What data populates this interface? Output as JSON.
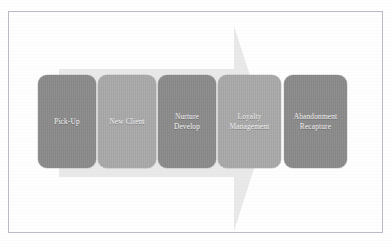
{
  "slide": {
    "title": "Client Lifecycle Process Flow",
    "background_color": "#ffffff",
    "frame_border_color": "#b9bcc4"
  },
  "arrow": {
    "name": "process-flow-arrow",
    "direction": "right",
    "color": "#e9e9e9",
    "shaft_top_y": 57,
    "shaft_bottom_y": 165,
    "head_start_x": 225,
    "tip_x": 258,
    "head_top_y": 14,
    "head_bottom_y": 219
  },
  "stages": [
    {
      "id": "pick-up",
      "label": "Pick-Up",
      "tone": "dark",
      "color": "#8b8b8b",
      "order": 1
    },
    {
      "id": "new-client",
      "label": "New Client",
      "tone": "light",
      "color": "#a9a9a9",
      "order": 2
    },
    {
      "id": "nurture-develop",
      "label": "Nurture\nDevelop",
      "tone": "dark",
      "color": "#8b8b8b",
      "order": 3
    },
    {
      "id": "loyalty-management",
      "label": "Loyalty\nManagement",
      "tone": "light",
      "color": "#a9a9a9",
      "order": 4
    },
    {
      "id": "abandonment-recapture",
      "label": "Abandonment\nRecapture",
      "tone": "dark",
      "color": "#8b8b8b",
      "order": 5
    }
  ]
}
